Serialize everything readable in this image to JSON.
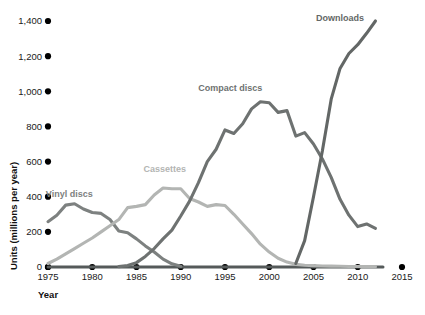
{
  "chart_data": {
    "type": "line",
    "title": "",
    "xlabel": "Year",
    "ylabel": "Units (millions per year)",
    "xlim": [
      1975,
      2015
    ],
    "ylim": [
      0,
      1400
    ],
    "xticks": [
      "1975",
      "1980",
      "1985",
      "1990",
      "1995",
      "2000",
      "2005",
      "2010",
      "2015"
    ],
    "yticks": [
      "0",
      "200",
      "400",
      "600",
      "800",
      "1,000",
      "1,200",
      "1,400"
    ],
    "grid": false,
    "legend_position": "inline-annotations",
    "series": [
      {
        "name": "Vinyl discs",
        "color": "#7d8180",
        "label_x": 1977.4,
        "label_y": 400,
        "x": [
          1975,
          1976,
          1977,
          1978,
          1979,
          1980,
          1981,
          1982,
          1983,
          1984,
          1985,
          1986,
          1987,
          1988,
          1989,
          1990
        ],
        "values": [
          258,
          295,
          352,
          360,
          330,
          310,
          305,
          270,
          205,
          195,
          160,
          120,
          85,
          45,
          18,
          4
        ]
      },
      {
        "name": "Cassettes",
        "color": "#b3b5b3",
        "label_x": 1988.2,
        "label_y": 540,
        "x": [
          1975,
          1976,
          1977,
          1978,
          1979,
          1980,
          1981,
          1982,
          1983,
          1984,
          1985,
          1986,
          1987,
          1988,
          1989,
          1990,
          1991,
          1992,
          1993,
          1994,
          1995,
          1996,
          1997,
          1998,
          1999,
          2000,
          2001,
          2002,
          2003,
          2004,
          2005,
          2006,
          2007,
          2008,
          2009,
          2010,
          2011,
          2012
        ],
        "values": [
          20,
          45,
          75,
          105,
          135,
          165,
          200,
          235,
          270,
          338,
          345,
          355,
          410,
          450,
          445,
          445,
          390,
          370,
          345,
          355,
          350,
          300,
          245,
          190,
          130,
          85,
          50,
          28,
          15,
          10,
          8,
          6,
          5,
          4,
          3,
          3,
          2,
          2
        ]
      },
      {
        "name": "Compact discs",
        "color": "#6e7271",
        "label_x": 1995.6,
        "label_y": 1000,
        "x": [
          1983,
          1984,
          1985,
          1986,
          1987,
          1988,
          1989,
          1990,
          1991,
          1992,
          1993,
          1994,
          1995,
          1996,
          1997,
          1998,
          1999,
          2000,
          2001,
          2002,
          2003,
          2004,
          2005,
          2006,
          2007,
          2008,
          2009,
          2010,
          2011,
          2012
        ],
        "values": [
          2,
          8,
          25,
          60,
          105,
          160,
          210,
          290,
          375,
          480,
          600,
          670,
          780,
          760,
          815,
          900,
          940,
          935,
          880,
          890,
          745,
          765,
          700,
          615,
          510,
          385,
          295,
          230,
          245,
          220
        ]
      },
      {
        "name": "Downloads",
        "color": "#636766",
        "label_x": 2008.0,
        "label_y": 1400,
        "x": [
          2003,
          2004,
          2005,
          2006,
          2007,
          2008,
          2009,
          2010,
          2011,
          2012
        ],
        "values": [
          20,
          150,
          400,
          660,
          955,
          1130,
          1215,
          1265,
          1330,
          1400
        ]
      }
    ]
  }
}
